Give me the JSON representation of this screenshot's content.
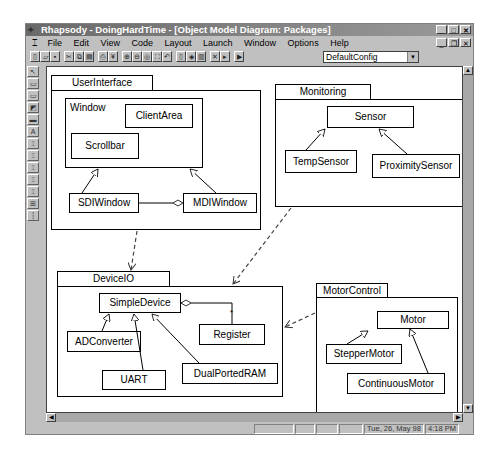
{
  "window": {
    "title": "Rhapsody - DoingHardTime - [Object Model Diagram: Packages]",
    "controls": [
      "minimize",
      "maximize",
      "close"
    ],
    "mdi_controls": [
      "minimize",
      "restore",
      "close"
    ]
  },
  "menubar": {
    "items": [
      {
        "label": "File"
      },
      {
        "label": "Edit"
      },
      {
        "label": "View"
      },
      {
        "label": "Code"
      },
      {
        "label": "Layout"
      },
      {
        "label": "Launch"
      },
      {
        "label": "Window"
      },
      {
        "label": "Options"
      },
      {
        "label": "Help"
      }
    ]
  },
  "toolbar": {
    "buttons": [
      "new-icon",
      "open-icon",
      "save-icon",
      "cut-icon",
      "copy-icon",
      "paste-icon",
      "print-icon",
      "properties-icon",
      "zoom-in-icon",
      "zoom-out-icon",
      "zoom-fit-icon",
      "zoom-full-icon",
      "zoom-undo-icon",
      "generate-icon",
      "edit-code-icon",
      "build-icon",
      "stop-icon",
      "run-icon",
      "animate-icon"
    ],
    "config_combo": {
      "value": "DefaultConfig"
    }
  },
  "palette": {
    "tools": [
      "select-arrow-icon",
      "class-icon",
      "package-icon",
      "object-icon",
      "composite-class-icon",
      "inheritance-icon",
      "association-icon",
      "directed-association-icon",
      "aggregation-icon",
      "composition-icon",
      "dependency-icon",
      "link-icon",
      "note-icon"
    ]
  },
  "diagram": {
    "packages": [
      {
        "name": "UserInterface"
      },
      {
        "name": "Monitoring"
      },
      {
        "name": "DeviceIO"
      },
      {
        "name": "MotorControl"
      }
    ],
    "userinterface": {
      "window_label": "Window",
      "clientarea": "ClientArea",
      "scrollbar": "Scrollbar",
      "sdiwindow": "SDIWindow",
      "mdiwindow": "MDIWindow"
    },
    "monitoring": {
      "sensor": "Sensor",
      "tempsensor": "TempSensor",
      "proximitysensor": "ProximitySensor"
    },
    "deviceio": {
      "simpledevice": "SimpleDevice",
      "register": "Register",
      "register_multiplicity": "*",
      "adconverter": "ADConverter",
      "uart": "UART",
      "dualportedram": "DualPortedRAM"
    },
    "motorcontrol": {
      "motor": "Motor",
      "steppermotor": "StepperMotor",
      "continuousmotor": "ContinuousMotor"
    }
  },
  "statusbar": {
    "date": "Tue, 26, May 98",
    "time": "4:18 PM"
  }
}
